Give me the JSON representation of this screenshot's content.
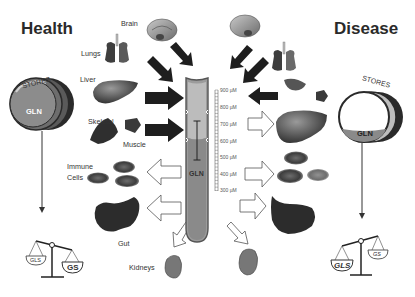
{
  "titles": {
    "left": "Health",
    "right": "Disease"
  },
  "organs_left": {
    "brain": "Brain",
    "lungs": "Lungs",
    "liver": "Liver",
    "skeletal": "Skeletal",
    "muscle": "Muscle",
    "immune": "Immune",
    "cells": "Cells",
    "gut": "Gut",
    "kidneys": "Kidneys"
  },
  "stores": {
    "left": {
      "label": "STORES",
      "content": "GLN",
      "fill": "full"
    },
    "right": {
      "label": "STORES",
      "content": "GLN",
      "fill": "low"
    }
  },
  "tube": {
    "label": "GLN",
    "scale_unit": "µM",
    "scale": [
      "900 µM",
      "800 µM",
      "700 µM",
      "600 µM",
      "500 µM",
      "400 µM",
      "300 µM"
    ]
  },
  "balance": {
    "left": {
      "left_pan": "GLS",
      "right_pan": "GS",
      "heavier": "GS"
    },
    "right": {
      "left_pan": "GLS",
      "right_pan": "GS",
      "heavier": "GLS"
    }
  },
  "colors": {
    "tube_fill_dark": "#8a8a8a",
    "tube_fill_light": "#b9b9b9",
    "tube_border": "#555555",
    "arrow_solid": "#1e1e1e",
    "arrow_outline": "#555555"
  }
}
